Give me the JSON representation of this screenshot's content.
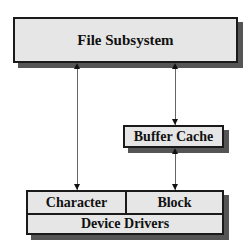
{
  "diagram": {
    "nodes": {
      "file_subsystem": "File Subsystem",
      "buffer_cache": "Buffer Cache",
      "device_drivers": "Device Drivers",
      "character": "Character",
      "block": "Block"
    },
    "edges": [
      {
        "from": "file_subsystem",
        "to": "character",
        "bidirectional": true
      },
      {
        "from": "file_subsystem",
        "to": "buffer_cache",
        "bidirectional": true
      },
      {
        "from": "buffer_cache",
        "to": "block",
        "bidirectional": true
      }
    ],
    "colors": {
      "box_fill": "#e6e6e6",
      "border": "#1a1a1a",
      "shadow": "#555555",
      "arrow": "#666666"
    }
  }
}
